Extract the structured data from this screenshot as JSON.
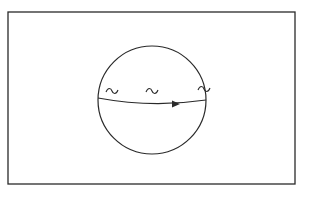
{
  "diagram": {
    "frame": {
      "x": 8,
      "y": 12,
      "width": 287,
      "height": 172,
      "stroke": "#2a2a2a"
    },
    "circle": {
      "cx": 152,
      "cy": 100,
      "r": 54,
      "stroke": "#2a2a2a"
    },
    "chord": {
      "start": [
        98,
        98
      ],
      "control": [
        152,
        108
      ],
      "end": [
        206,
        100
      ],
      "direction": "left-to-right"
    },
    "arrowhead": {
      "x": 176,
      "y": 104
    },
    "tildes": [
      {
        "x": 112,
        "y": 91
      },
      {
        "x": 152,
        "y": 91
      },
      {
        "x": 204,
        "y": 89
      }
    ],
    "colors": {
      "ink": "#2a2a2a",
      "background": "#ffffff"
    }
  }
}
